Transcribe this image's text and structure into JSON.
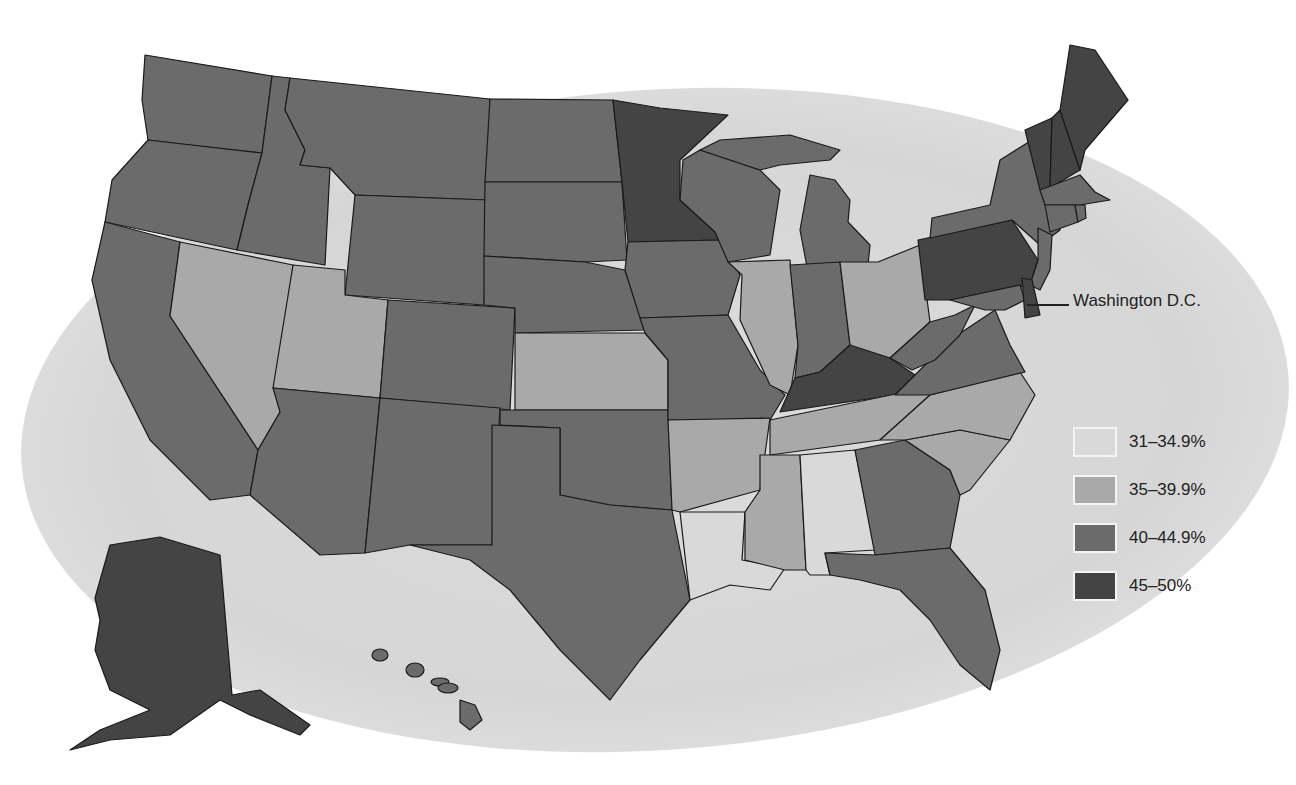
{
  "map": {
    "annotation": "Washington D.C.",
    "tier_colors": {
      "t1": "#d9d9d9",
      "t2": "#a9a9a9",
      "t3": "#6b6b6b",
      "t4": "#444444"
    }
  },
  "legend": {
    "items": [
      {
        "label": "31–34.9%",
        "color": "#d9d9d9"
      },
      {
        "label": "35–39.9%",
        "color": "#a9a9a9"
      },
      {
        "label": "40–44.9%",
        "color": "#6b6b6b"
      },
      {
        "label": "45–50%",
        "color": "#444444"
      }
    ]
  },
  "states": {
    "31-34.9%": [
      "Alabama",
      "Louisiana"
    ],
    "35-39.9%": [
      "Nevada",
      "Utah",
      "Kansas",
      "Arkansas",
      "Illinois",
      "Ohio",
      "Tennessee",
      "Mississippi",
      "North Carolina",
      "South Carolina"
    ],
    "40-44.9%": [
      "Washington",
      "Oregon",
      "California",
      "Idaho",
      "Montana",
      "Wyoming",
      "Colorado",
      "Arizona",
      "New Mexico",
      "Texas",
      "Oklahoma",
      "Nebraska",
      "South Dakota",
      "North Dakota",
      "Iowa",
      "Missouri",
      "Wisconsin",
      "Michigan",
      "Indiana",
      "West Virginia",
      "Virginia",
      "Georgia",
      "Florida",
      "New York",
      "New Jersey",
      "Maryland",
      "Massachusetts",
      "Connecticut",
      "Rhode Island",
      "Hawaii"
    ],
    "45-50%": [
      "Minnesota",
      "Kentucky",
      "Pennsylvania",
      "Vermont",
      "New Hampshire",
      "Maine",
      "Delaware",
      "Alaska"
    ]
  }
}
